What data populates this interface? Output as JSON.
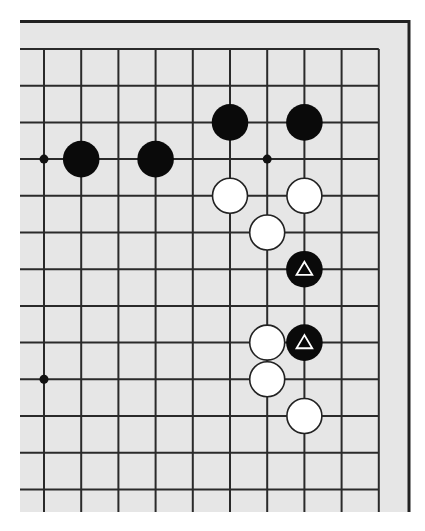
{
  "diagram": {
    "type": "go-board-fragment",
    "board_color": "#e6e6e6",
    "line_color": "#2a2a2a",
    "border_color": "#222222",
    "edges_shown": [
      "top",
      "right"
    ],
    "grid": {
      "columns_visible": 10,
      "rows_visible": 13,
      "origin_x": 44,
      "origin_y": 49,
      "spacing_x": 37.2,
      "spacing_y": 36.7
    },
    "star_points": [
      {
        "col": 0,
        "row": 3
      },
      {
        "col": 6,
        "row": 3
      },
      {
        "col": 0,
        "row": 9
      }
    ],
    "stones": [
      {
        "color": "black",
        "col": 1,
        "row": 3,
        "mark": ""
      },
      {
        "color": "black",
        "col": 3,
        "row": 3,
        "mark": ""
      },
      {
        "color": "black",
        "col": 5,
        "row": 2,
        "mark": ""
      },
      {
        "color": "black",
        "col": 7,
        "row": 2,
        "mark": ""
      },
      {
        "color": "white",
        "col": 5,
        "row": 4,
        "mark": ""
      },
      {
        "color": "white",
        "col": 7,
        "row": 4,
        "mark": ""
      },
      {
        "color": "white",
        "col": 6,
        "row": 5,
        "mark": ""
      },
      {
        "color": "black",
        "col": 7,
        "row": 6,
        "mark": "triangle"
      },
      {
        "color": "white",
        "col": 6,
        "row": 8,
        "mark": ""
      },
      {
        "color": "black",
        "col": 7,
        "row": 8,
        "mark": "triangle"
      },
      {
        "color": "white",
        "col": 6,
        "row": 9,
        "mark": ""
      },
      {
        "color": "white",
        "col": 7,
        "row": 10,
        "mark": ""
      }
    ]
  }
}
